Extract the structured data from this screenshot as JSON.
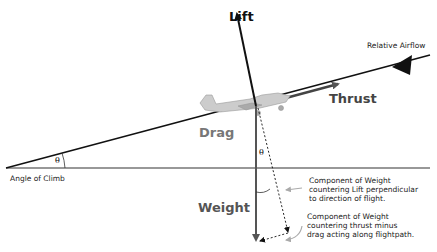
{
  "labels": {
    "lift": "Lift",
    "thrust": "Thrust",
    "drag": "Drag",
    "weight": "Weight",
    "relative_airflow": "Relative Airflow",
    "angle_of_climb": "Angle of Climb",
    "theta_left": "θ",
    "theta_right": "θ",
    "component_perpendicular": [
      "Component of Weight",
      "countering Lift perpendicular",
      "to direction of flight."
    ],
    "component_along": [
      "Component of Weight",
      "countering thrust minus",
      "drag acting along flightpath."
    ]
  },
  "colors": {
    "primary": "#111111",
    "weight": "#555555",
    "drag": "#777777",
    "thrust": "#444444",
    "pointer": "#aaaaaa"
  }
}
